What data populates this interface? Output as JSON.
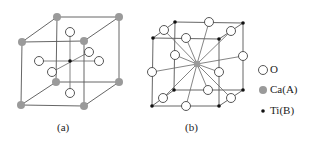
{
  "figure": {
    "panels": [
      {
        "id": "a",
        "caption": "(a)",
        "description": "ABO3 perovskite unit cell with Ca(A) at corners, Ti(B) at body center, O at face centers"
      },
      {
        "id": "b",
        "caption": "(b)",
        "description": "Alternative perovskite unit cell with Ti(B) at corners, Ca(A) at body center, O at edge midpoints"
      }
    ],
    "legend": [
      {
        "symbol": "open-circle",
        "label": "O"
      },
      {
        "symbol": "gray-circle",
        "label": "Ca(A)"
      },
      {
        "symbol": "black-dot",
        "label": "Ti(B)"
      }
    ],
    "colors": {
      "oxygen_fill": "#ffffff",
      "oxygen_stroke": "#444444",
      "calcium": "#9a9a9a",
      "titanium": "#111111",
      "edges": "#555555"
    }
  }
}
